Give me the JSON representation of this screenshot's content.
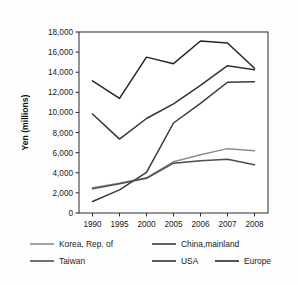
{
  "figure": {
    "background_color": "#fdfdfd",
    "plot_background_color": "#ffffff",
    "axis_color": "#2b2b2b"
  },
  "chart_data": {
    "type": "line",
    "title": "",
    "subtitle": "",
    "xlabel": "",
    "ylabel": "Yen (millions)",
    "categories": [
      "1990",
      "1995",
      "2000",
      "2005",
      "2006",
      "2007",
      "2008"
    ],
    "ylim": [
      0,
      18000
    ],
    "ytick_values": [
      0,
      2000,
      4000,
      6000,
      8000,
      10000,
      12000,
      14000,
      16000,
      18000
    ],
    "ytick_labels": [
      "0",
      "2,000",
      "4,000",
      "6,000",
      "8,000",
      "10,000",
      "12,000",
      "14,000",
      "16,000",
      "18,000"
    ],
    "grid": false,
    "legend_position": "bottom",
    "series": [
      {
        "name": "Korea, Rep. of",
        "color": "#8c8c8c",
        "width": 1.5,
        "values": [
          2500,
          2950,
          3500,
          5100,
          5800,
          6400,
          6200
        ]
      },
      {
        "name": "China,mainland",
        "color": "#3a3a3a",
        "width": 1.5,
        "values": [
          1150,
          2300,
          4050,
          8950,
          10900,
          13000,
          13050
        ]
      },
      {
        "name": "Taiwan",
        "color": "#4d4d4d",
        "width": 1.5,
        "values": [
          2400,
          2900,
          3450,
          4950,
          5200,
          5350,
          4800
        ]
      },
      {
        "name": "USA",
        "color": "#333333",
        "width": 1.5,
        "values": [
          9850,
          7350,
          9400,
          10850,
          12700,
          14650,
          14250
        ]
      },
      {
        "name": "Europe",
        "color": "#262626",
        "width": 1.5,
        "values": [
          13150,
          11400,
          15500,
          14850,
          17100,
          16900,
          14400
        ]
      }
    ]
  },
  "legend": {
    "rows": [
      [
        {
          "label": "Korea, Rep. of",
          "color": "#8c8c8c"
        },
        {
          "label": "China,mainland",
          "color": "#3a3a3a"
        }
      ],
      [
        {
          "label": "Taiwan",
          "color": "#4d4d4d"
        },
        {
          "label": "USA",
          "color": "#333333"
        },
        {
          "label": "Europe",
          "color": "#262626"
        }
      ]
    ]
  }
}
